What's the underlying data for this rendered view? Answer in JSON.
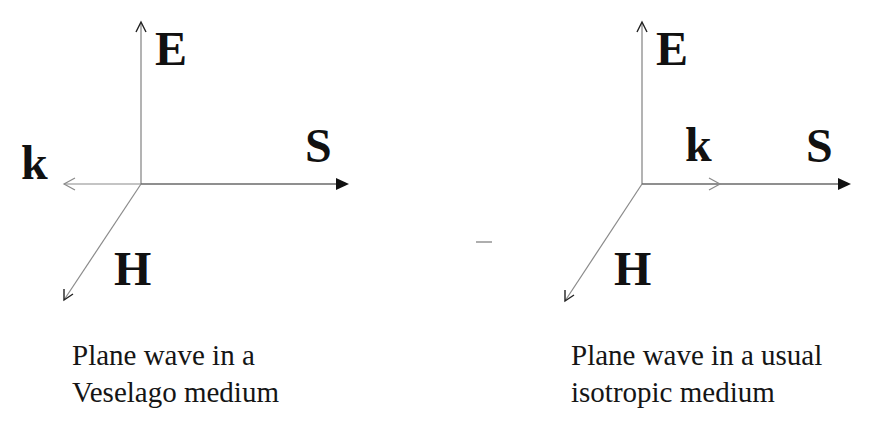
{
  "figure": {
    "type": "vector-triad-comparison",
    "colors": {
      "axis_line": "#8a8a8a",
      "s_arrow": "#222222",
      "label": "#111111",
      "background": "#ffffff"
    },
    "panels": [
      {
        "id": "veselago",
        "labels": {
          "E": "E",
          "S": "S",
          "k": "k",
          "H": "H"
        },
        "k_direction": "opposite to S (backward wave)",
        "caption": {
          "line1": "Plane wave in a",
          "line2": "Veselago medium"
        }
      },
      {
        "id": "isotropic",
        "labels": {
          "E": "E",
          "S": "S",
          "k": "k",
          "H": "H"
        },
        "k_direction": "parallel to S",
        "caption": {
          "line1": "Plane wave in a usual",
          "line2": "isotropic medium"
        }
      }
    ]
  }
}
